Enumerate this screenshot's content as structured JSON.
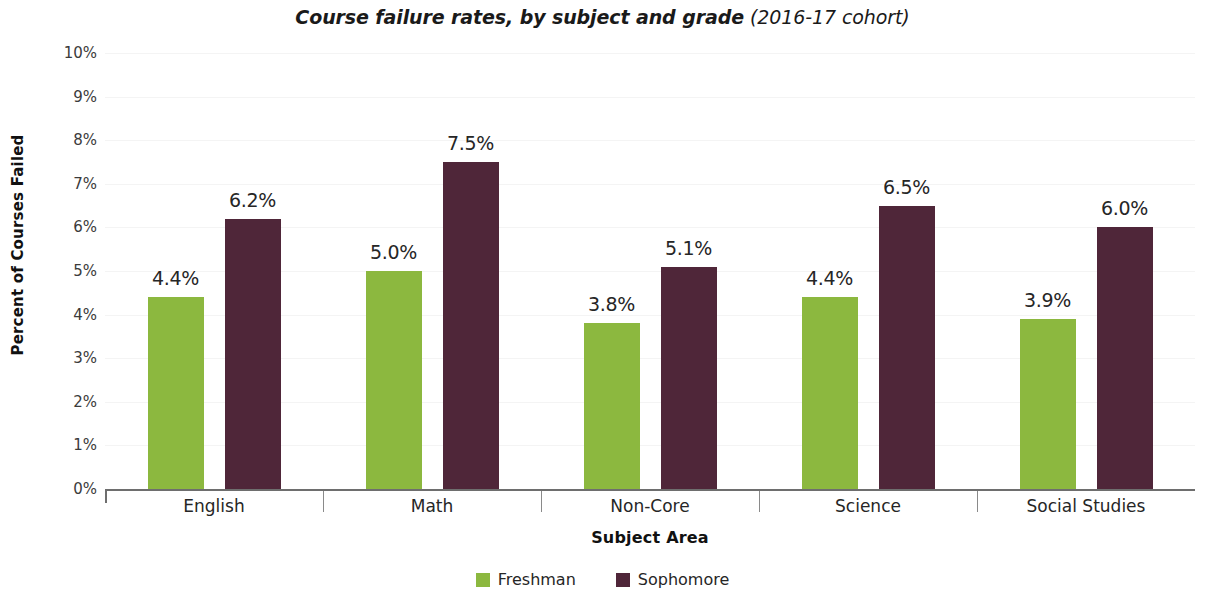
{
  "chart_data": {
    "type": "bar",
    "title": "Course failure rates, by subject and grade (2016-17 cohort)",
    "title_main": "Course failure rates, by subject and grade",
    "title_sub": "(2016-17 cohort)",
    "xlabel": "Subject Area",
    "ylabel": "Percent of Courses Failed",
    "categories": [
      "English",
      "Math",
      "Non-Core",
      "Science",
      "Social Studies"
    ],
    "ylim": [
      0,
      10
    ],
    "ytick_values": [
      10,
      9,
      8,
      7,
      6,
      5,
      4,
      3,
      2,
      1,
      0
    ],
    "ytick_labels": [
      "10%",
      "9%",
      "8%",
      "7%",
      "6%",
      "5%",
      "4%",
      "3%",
      "2%",
      "1%",
      "0%"
    ],
    "grid": true,
    "legend_position": "bottom",
    "series": [
      {
        "name": "Freshman",
        "color": "#8cb83f",
        "values": [
          4.4,
          5.0,
          3.8,
          4.4,
          3.9
        ],
        "labels": [
          "4.4%",
          "5.0%",
          "3.8%",
          "4.4%",
          "3.9%"
        ]
      },
      {
        "name": "Sophomore",
        "color": "#4f2639",
        "values": [
          6.2,
          7.5,
          5.1,
          6.5,
          6.0
        ],
        "labels": [
          "6.2%",
          "7.5%",
          "5.1%",
          "6.5%",
          "6.0%"
        ]
      }
    ]
  },
  "legend": {
    "items": [
      {
        "label": "Freshman",
        "color": "#8cb83f"
      },
      {
        "label": "Sophomore",
        "color": "#4f2639"
      }
    ]
  }
}
